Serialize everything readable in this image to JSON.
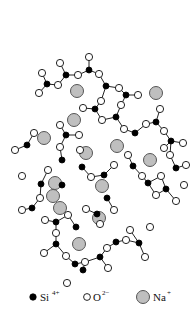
{
  "diagram": {
    "title": "",
    "legend": [
      {
        "symbol": "filled-black-dot",
        "label": "Si",
        "charge": "4+"
      },
      {
        "symbol": "open-circle",
        "label": "O",
        "charge": "2−"
      },
      {
        "symbol": "gray-circle",
        "label": "Na",
        "charge": "+"
      }
    ],
    "colors": {
      "si": "#000000",
      "o": "#ffffff",
      "na": "#bfbfbf",
      "bond": "#222222"
    },
    "si": [
      [
        89,
        70
      ],
      [
        66,
        75
      ],
      [
        47,
        84
      ],
      [
        106,
        86
      ],
      [
        126,
        95
      ],
      [
        95,
        109
      ],
      [
        116,
        117
      ],
      [
        135,
        133
      ],
      [
        156,
        122
      ],
      [
        171,
        141
      ],
      [
        66,
        135
      ],
      [
        27,
        145
      ],
      [
        62,
        160
      ],
      [
        41,
        184
      ],
      [
        62,
        185
      ],
      [
        82,
        167
      ],
      [
        104,
        175
      ],
      [
        133,
        166
      ],
      [
        148,
        183
      ],
      [
        176,
        168
      ],
      [
        166,
        189
      ],
      [
        32,
        208
      ],
      [
        56,
        222
      ],
      [
        97,
        214
      ],
      [
        76,
        227
      ],
      [
        56,
        244
      ],
      [
        75,
        264
      ],
      [
        100,
        257
      ],
      [
        116,
        242
      ],
      [
        139,
        243
      ],
      [
        107,
        198
      ],
      [
        83,
        270
      ]
    ],
    "o": [
      [
        89,
        57
      ],
      [
        78,
        75
      ],
      [
        60,
        63
      ],
      [
        42,
        73
      ],
      [
        58,
        85
      ],
      [
        39,
        93
      ],
      [
        99,
        74
      ],
      [
        119,
        88
      ],
      [
        138,
        95
      ],
      [
        101,
        101
      ],
      [
        83,
        108
      ],
      [
        102,
        120
      ],
      [
        121,
        105
      ],
      [
        124,
        129
      ],
      [
        146,
        124
      ],
      [
        160,
        109
      ],
      [
        164,
        131
      ],
      [
        183,
        143
      ],
      [
        164,
        148
      ],
      [
        60,
        125
      ],
      [
        79,
        135
      ],
      [
        60,
        147
      ],
      [
        15,
        150
      ],
      [
        34,
        133
      ],
      [
        48,
        170
      ],
      [
        22,
        176
      ],
      [
        80,
        150
      ],
      [
        91,
        177
      ],
      [
        114,
        165
      ],
      [
        128,
        155
      ],
      [
        142,
        176
      ],
      [
        161,
        176
      ],
      [
        186,
        165
      ],
      [
        170,
        155
      ],
      [
        176,
        201
      ],
      [
        156,
        195
      ],
      [
        184,
        185
      ],
      [
        22,
        210
      ],
      [
        40,
        198
      ],
      [
        45,
        220
      ],
      [
        68,
        215
      ],
      [
        86,
        209
      ],
      [
        114,
        210
      ],
      [
        100,
        224
      ],
      [
        56,
        233
      ],
      [
        44,
        253
      ],
      [
        66,
        256
      ],
      [
        85,
        262
      ],
      [
        107,
        248
      ],
      [
        126,
        240
      ],
      [
        150,
        227
      ],
      [
        145,
        257
      ],
      [
        108,
        268
      ],
      [
        67,
        283
      ],
      [
        130,
        230
      ]
    ],
    "na": [
      [
        77,
        91
      ],
      [
        156,
        93
      ],
      [
        44,
        138
      ],
      [
        74,
        120
      ],
      [
        117,
        146
      ],
      [
        86,
        153
      ],
      [
        150,
        160
      ],
      [
        55,
        183
      ],
      [
        102,
        186
      ],
      [
        53,
        196
      ],
      [
        99,
        218
      ],
      [
        79,
        244
      ],
      [
        60,
        208
      ]
    ],
    "bonds": [
      [
        0,
        "o",
        0
      ],
      [
        0,
        "o",
        1
      ],
      [
        1,
        "o",
        1
      ],
      [
        1,
        "o",
        2
      ],
      [
        1,
        "o",
        4
      ],
      [
        2,
        "o",
        3
      ],
      [
        2,
        "o",
        4
      ],
      [
        2,
        "o",
        5
      ],
      [
        0,
        "o",
        6
      ],
      [
        3,
        "o",
        6
      ],
      [
        3,
        "o",
        7
      ],
      [
        3,
        "o",
        9
      ],
      [
        4,
        "o",
        7
      ],
      [
        4,
        "o",
        8
      ],
      [
        4,
        "o",
        12
      ],
      [
        5,
        "o",
        9
      ],
      [
        5,
        "o",
        10
      ],
      [
        5,
        "o",
        11
      ],
      [
        6,
        "o",
        11
      ],
      [
        6,
        "o",
        12
      ],
      [
        6,
        "o",
        13
      ],
      [
        7,
        "o",
        13
      ],
      [
        7,
        "o",
        14
      ],
      [
        8,
        "o",
        14
      ],
      [
        8,
        "o",
        15
      ],
      [
        8,
        "o",
        16
      ],
      [
        9,
        "o",
        16
      ],
      [
        9,
        "o",
        17
      ],
      [
        9,
        "o",
        18
      ],
      [
        10,
        "o",
        19
      ],
      [
        10,
        "o",
        20
      ],
      [
        10,
        "o",
        21
      ],
      [
        11,
        "o",
        22
      ],
      [
        11,
        "o",
        23
      ],
      [
        12,
        "o",
        21
      ],
      [
        12,
        "o",
        24
      ]
    ]
  }
}
